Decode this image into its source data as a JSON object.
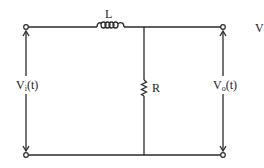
{
  "diagram": {
    "type": "circuit-schematic",
    "components": {
      "inductor": {
        "label": "L"
      },
      "resistor": {
        "label": "R"
      }
    },
    "ports": {
      "input": {
        "label_main": "V",
        "label_sub": "i",
        "label_suffix": "(t)"
      },
      "output": {
        "label_main": "V",
        "label_sub": "o",
        "label_suffix": "(t)"
      }
    },
    "clipped_text": "V",
    "colors": {
      "wire": "#2a2a2a",
      "background": "#ffffff"
    }
  }
}
